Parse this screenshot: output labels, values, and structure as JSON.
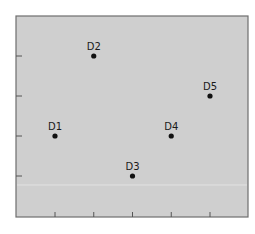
{
  "chart_data": {
    "type": "scatter",
    "title": "",
    "xlabel": "",
    "ylabel": "",
    "xlim": [
      0,
      5.9
    ],
    "ylim": [
      0,
      5
    ],
    "x_ticks": [
      1,
      2,
      3,
      4,
      5
    ],
    "y_ticks": [
      1,
      2,
      3,
      4
    ],
    "tick_labels_visible": false,
    "grid": false,
    "legend": null,
    "points": [
      {
        "label": "D1",
        "x": 1,
        "y": 2
      },
      {
        "label": "D2",
        "x": 2,
        "y": 4
      },
      {
        "label": "D3",
        "x": 3,
        "y": 1
      },
      {
        "label": "D4",
        "x": 4,
        "y": 2
      },
      {
        "label": "D5",
        "x": 5,
        "y": 3
      }
    ],
    "colors": {
      "background": "#cfcfcf",
      "frame": "#6e6e6e",
      "point": "#111111"
    }
  }
}
